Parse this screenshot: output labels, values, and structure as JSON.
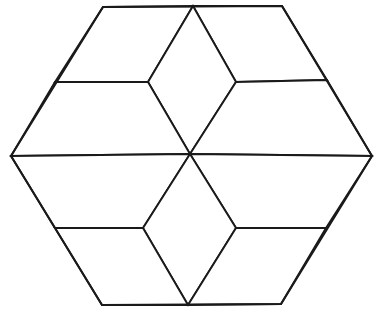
{
  "figure": {
    "canvas": {
      "width": 381,
      "height": 320
    },
    "style": {
      "background_color": "#ffffff",
      "stroke_color": "#1a1a1a",
      "fill_color": "#ffffff",
      "stroke_width": 1.9,
      "outline_stroke_width": 2.0
    },
    "points": {
      "hex_top_left": [
        103,
        7
      ],
      "hex_top_right": [
        282,
        6
      ],
      "hex_right": [
        372,
        156
      ],
      "hex_bottom_right": [
        281,
        304
      ],
      "hex_bottom_left": [
        102,
        305
      ],
      "hex_left": [
        11,
        156
      ],
      "top_center": [
        193,
        6
      ],
      "bottom_center": [
        188,
        305
      ],
      "center": [
        190,
        154
      ],
      "inner_upper_left": [
        148,
        82
      ],
      "inner_upper_right": [
        236,
        82
      ],
      "inner_lower_left": [
        143,
        228
      ],
      "inner_lower_right": [
        236,
        228
      ],
      "edge_left_upper": [
        55,
        82
      ],
      "edge_left_lower": [
        55,
        228
      ],
      "edge_right_upper": [
        327,
        80
      ],
      "edge_right_lower": [
        326,
        228
      ]
    },
    "outline": "103,7 282,6 372,156 281,304 102,305 11,156",
    "rhombi": [
      {
        "name": "rhombus-top-left",
        "points": "103,7 193,6 148,82 55,82",
        "orientation": "upper-left face"
      },
      {
        "name": "rhombus-top-right",
        "points": "193,6 282,6 327,80 236,82",
        "orientation": "upper-right face"
      },
      {
        "name": "rhombus-top-center",
        "points": "193,6 236,82 190,154 148,82",
        "orientation": "top inner face"
      },
      {
        "name": "rhombus-left",
        "points": "55,82 148,82 190,154 11,156",
        "orientation": "left middle face"
      },
      {
        "name": "rhombus-right",
        "points": "236,82 327,80 372,156 190,154",
        "orientation": "right middle face"
      },
      {
        "name": "rhombus-left-lower",
        "points": "11,156 190,154 143,228 55,228",
        "orientation": "lower-left face"
      },
      {
        "name": "rhombus-right-lower",
        "points": "190,154 372,156 326,228 236,228",
        "orientation": "lower-right face"
      },
      {
        "name": "rhombus-bottom-center",
        "points": "190,154 236,228 188,305 143,228",
        "orientation": "bottom inner face"
      },
      {
        "name": "rhombus-bottom-left",
        "points": "55,228 143,228 188,305 102,305",
        "orientation": "bottom-left face"
      },
      {
        "name": "rhombus-bottom-right",
        "points": "236,228 326,228 281,304 188,305",
        "orientation": "bottom-right face"
      }
    ],
    "internal_edges": [
      {
        "name": "edge-top-center-to-inner-upper-left",
        "from": [
          193,
          6
        ],
        "to": [
          148,
          82
        ]
      },
      {
        "name": "edge-top-center-to-inner-upper-right",
        "from": [
          193,
          6
        ],
        "to": [
          236,
          82
        ]
      },
      {
        "name": "edge-left-upper-to-inner-upper-left",
        "from": [
          55,
          82
        ],
        "to": [
          148,
          82
        ]
      },
      {
        "name": "edge-inner-upper-right-to-right-upper",
        "from": [
          236,
          82
        ],
        "to": [
          327,
          80
        ]
      },
      {
        "name": "edge-inner-upper-left-to-center",
        "from": [
          148,
          82
        ],
        "to": [
          190,
          154
        ]
      },
      {
        "name": "edge-inner-upper-right-to-center",
        "from": [
          236,
          82
        ],
        "to": [
          190,
          154
        ]
      },
      {
        "name": "edge-hex-left-to-center",
        "from": [
          11,
          156
        ],
        "to": [
          190,
          154
        ]
      },
      {
        "name": "edge-center-to-hex-right",
        "from": [
          190,
          154
        ],
        "to": [
          372,
          156
        ]
      },
      {
        "name": "edge-center-to-inner-lower-left",
        "from": [
          190,
          154
        ],
        "to": [
          143,
          228
        ]
      },
      {
        "name": "edge-center-to-inner-lower-right",
        "from": [
          190,
          154
        ],
        "to": [
          236,
          228
        ]
      },
      {
        "name": "edge-left-lower-to-inner-lower-left",
        "from": [
          55,
          228
        ],
        "to": [
          143,
          228
        ]
      },
      {
        "name": "edge-inner-lower-right-to-right-lower",
        "from": [
          236,
          228
        ],
        "to": [
          326,
          228
        ]
      },
      {
        "name": "edge-inner-lower-left-to-bottom",
        "from": [
          143,
          228
        ],
        "to": [
          188,
          305
        ]
      },
      {
        "name": "edge-inner-lower-right-to-bottom",
        "from": [
          236,
          228
        ],
        "to": [
          188,
          305
        ]
      }
    ]
  }
}
